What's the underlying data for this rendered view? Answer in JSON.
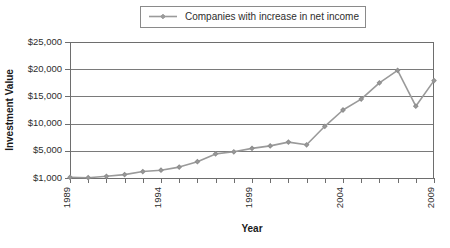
{
  "chart_data": {
    "type": "line",
    "title": "",
    "xlabel": "Year",
    "ylabel": "Investment Value",
    "grid": true,
    "legend_position": "top-center",
    "x": [
      1989,
      1990,
      1991,
      1992,
      1993,
      1994,
      1995,
      1996,
      1997,
      1998,
      1999,
      2000,
      2001,
      2002,
      2003,
      2004,
      2005,
      2006,
      2007,
      2008,
      2009
    ],
    "xtick_labels": [
      "1989",
      "",
      "",
      "",
      "",
      "1994",
      "",
      "",
      "",
      "",
      "1999",
      "",
      "",
      "",
      "",
      "2004",
      "",
      "",
      "",
      "",
      "2009"
    ],
    "ytick_labels": [
      "$1,000",
      "$5,000",
      "$10,000",
      "$15,000",
      "$20,000",
      "$25,000"
    ],
    "ytick_values": [
      1000,
      5000,
      10000,
      15000,
      20000,
      25000
    ],
    "ylim": [
      1000,
      25000
    ],
    "xlim": [
      1989,
      2009
    ],
    "series": [
      {
        "name": "Companies with increase in net income",
        "color": "#9a9a9a",
        "marker": "diamond",
        "values": [
          1100,
          1050,
          1250,
          1500,
          1950,
          2150,
          2600,
          3400,
          4550,
          4850,
          5450,
          5900,
          6600,
          6100,
          9500,
          12500,
          14500,
          17500,
          19800,
          13200,
          17900
        ]
      }
    ]
  },
  "legend": {
    "entries": [
      {
        "label": "Companies with increase in net income"
      }
    ]
  },
  "axes": {
    "y_title": "Investment Value",
    "x_title": "Year"
  }
}
